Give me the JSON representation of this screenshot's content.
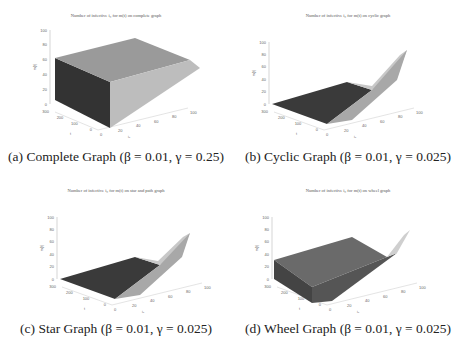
{
  "chart_data": [
    {
      "type": "surface3d",
      "title": "Number of infective i0 for m(t) on complete graph",
      "caption": "(a) Complete Graph (β = 0.01, γ = 0.25)",
      "xlabel": "i0",
      "ylabel": "t",
      "zlabel": "m(t)",
      "x_ticks": [
        0,
        20,
        40,
        60,
        80,
        100
      ],
      "y_ticks": [
        0,
        100,
        200,
        300
      ],
      "z_ticks": [
        0,
        20,
        40,
        60,
        80,
        100
      ],
      "xlim": [
        0,
        100
      ],
      "ylim": [
        0,
        300
      ],
      "zlim": [
        0,
        100
      ],
      "description": "Surface rises sharply to plateau ~75 across t for all i0>0; steep face near i0=0",
      "plateau": 75
    },
    {
      "type": "surface3d",
      "title": "Number of infective i0 for m(t) on cyclic graph",
      "caption": "(b) Cyclic Graph (β = 0.01, γ = 0.025)",
      "xlabel": "i0",
      "ylabel": "t",
      "zlabel": "m(t)",
      "x_ticks": [
        0,
        20,
        40,
        60,
        80,
        100
      ],
      "y_ticks": [
        0,
        100,
        200,
        300
      ],
      "z_ticks": [
        0,
        20,
        40,
        60,
        80,
        100
      ],
      "xlim": [
        0,
        100
      ],
      "ylim": [
        0,
        300
      ],
      "zlim": [
        0,
        100
      ],
      "description": "Surface near 0 for most of domain, rising to ~80 at t=0, i0=100",
      "peak": 80
    },
    {
      "type": "surface3d",
      "title": "Number of infective i0 for m(t) on star and path graph",
      "caption": "(c) Star Graph (β = 0.01, γ = 0.025)",
      "xlabel": "i0",
      "ylabel": "t",
      "zlabel": "m(t)",
      "x_ticks": [
        0,
        20,
        40,
        60,
        80,
        100
      ],
      "y_ticks": [
        0,
        100,
        200,
        300
      ],
      "z_ticks": [
        0,
        20,
        40,
        60,
        80,
        100
      ],
      "xlim": [
        0,
        100
      ],
      "ylim": [
        0,
        300
      ],
      "zlim": [
        0,
        100
      ],
      "description": "Surface near 0 for most of domain, rising to ~75 at t=0, i0=100",
      "peak": 75
    },
    {
      "type": "surface3d",
      "title": "Number of infective i0 for m(t) on wheel graph",
      "caption": "(d) Wheel Graph (β = 0.01, γ = 0.025)",
      "xlabel": "i0",
      "ylabel": "t",
      "zlabel": "m(t)",
      "x_ticks": [
        0,
        20,
        40,
        60,
        80,
        100
      ],
      "y_ticks": [
        0,
        100,
        200,
        300
      ],
      "z_ticks": [
        0,
        20,
        40,
        60,
        80,
        100
      ],
      "xlim": [
        0,
        100
      ],
      "ylim": [
        0,
        300
      ],
      "zlim": [
        0,
        100
      ],
      "description": "Surface plateau ~30 across t, rising to ~85 at t=0, i0=100",
      "plateau": 30,
      "peak": 85
    }
  ],
  "panels": [
    {
      "title": "Number of infective i₀ for m(t) on complete graph",
      "caption": "(a) Complete Graph (β = 0.01, γ = 0.25)"
    },
    {
      "title": "Number of infective i₀ for m(t) on cyclic graph",
      "caption": "(b) Cyclic Graph (β = 0.01, γ = 0.025)"
    },
    {
      "title": "Number of infective i₀ for m(t) on star and path graph",
      "caption": "(c) Star Graph (β = 0.01, γ = 0.025)"
    },
    {
      "title": "Number of infective i₀ for m(t) on wheel graph",
      "caption": "(d) Wheel Graph (β = 0.01, γ = 0.025)"
    }
  ],
  "axes": {
    "z_label": "m(t)",
    "y_label": "t",
    "x_label": "i₀",
    "z_ticks": [
      "0",
      "20",
      "40",
      "60",
      "80",
      "100"
    ],
    "y_ticks": [
      "300",
      "200",
      "100",
      "0"
    ],
    "x_ticks": [
      "0",
      "20",
      "40",
      "60",
      "80",
      "100"
    ]
  }
}
